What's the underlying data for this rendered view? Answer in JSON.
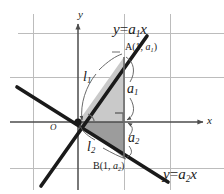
{
  "figure": {
    "axes": {
      "x_label": "x",
      "y_label": "y",
      "origin_label": "O"
    },
    "lines": [
      {
        "id": "l1",
        "name_label": "l",
        "name_sub": "1",
        "equation_lhs": "y",
        "equation_op": "=",
        "equation_slope": "a",
        "equation_slope_sub": "1",
        "equation_var": "x",
        "equation_text": "y = a₁x"
      },
      {
        "id": "l2",
        "name_label": "l",
        "name_sub": "2",
        "equation_lhs": "y",
        "equation_op": "=",
        "equation_slope": "a",
        "equation_slope_sub": "2",
        "equation_var": "x",
        "equation_text": "y = a₂x"
      }
    ],
    "points": [
      {
        "id": "A",
        "label_name": "A",
        "label_open": "(",
        "label_x": "1",
        "label_comma": ", ",
        "label_y": "a",
        "label_y_sub": "1",
        "label_close": ")",
        "text": "A(1, a₁)"
      },
      {
        "id": "B",
        "label_name": "B",
        "label_open": "(",
        "label_x": "1",
        "label_comma": ", ",
        "label_y": "a",
        "label_y_sub": "2",
        "label_close": ")",
        "text": "B(1, a₂)"
      }
    ],
    "segments": [
      {
        "id": "a1",
        "label": "a",
        "label_sub": "1",
        "text": "a₁"
      },
      {
        "id": "a2",
        "label": "a",
        "label_sub": "2",
        "text": "a₂"
      }
    ],
    "colors": {
      "line_stroke": "#1a1a1a",
      "axis_stroke": "#4d4d4d",
      "grid_stroke": "#b3b3b3",
      "upper_triangle_fill": "#c9c9c9",
      "lower_triangle_fill": "#9e9e9e",
      "text": "#1a1a1a",
      "background": "#ffffff"
    },
    "geometry": {
      "origin_px": [
        78,
        122
      ],
      "point_A_px": [
        124,
        57
      ],
      "point_B_px": [
        124,
        158
      ],
      "grid_spacing_px": 45,
      "x_axis_end_px": [
        205,
        122
      ],
      "y_axis_end_px": [
        78,
        22
      ]
    }
  }
}
